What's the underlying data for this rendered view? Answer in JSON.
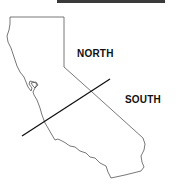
{
  "map": {
    "region": "California",
    "regions": [
      {
        "id": "north",
        "label": "NORTH"
      },
      {
        "id": "south",
        "label": "SOUTH"
      }
    ],
    "colors": {
      "outline": "#555555",
      "divider": "#111111",
      "text": "#111111",
      "background": "#ffffff",
      "topbar": "#3a3a3a"
    }
  }
}
